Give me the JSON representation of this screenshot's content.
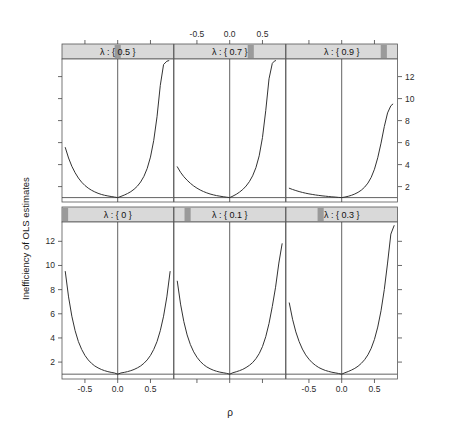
{
  "figure": {
    "ylabel": "Inefficiency of OLS estimates",
    "xlabel": "ρ",
    "background": "#ffffff",
    "line_color": "#333333",
    "strip_fill": "#d9d9d9",
    "strip_marker": "#9a9a9a",
    "border_color": "#555555"
  },
  "chart_data": {
    "type": "line",
    "title": "",
    "subtitle": "",
    "xlabel": "ρ",
    "ylabel": "Inefficiency of OLS estimates",
    "conditioning_variable": "λ",
    "layout": {
      "rows": 2,
      "cols": 3,
      "order": "lattice-bottom-left-first"
    },
    "xlim": [
      -0.85,
      0.85
    ],
    "ylim": [
      0.6,
      13.6
    ],
    "xticks": [
      -0.5,
      0.0,
      0.5
    ],
    "xtick_labels": [
      "-0.5",
      "0.0",
      "0.5"
    ],
    "yticks": [
      2,
      4,
      6,
      8,
      10,
      12
    ],
    "ytick_labels": [
      "2",
      "4",
      "6",
      "8",
      "10",
      "12"
    ],
    "grid": false,
    "legend": null,
    "reference_lines": {
      "vertical_x": 0.0,
      "horizontal_y": 1.0
    },
    "axis_label_placement": {
      "top_axis_labeled_panels": [
        "top-middle"
      ],
      "bottom_axis_labeled_panels": [
        "bottom-left",
        "bottom-right"
      ],
      "left_axis_labeled_rows": [
        "bottom"
      ],
      "right_axis_labeled_rows": [
        "top"
      ]
    },
    "panels": [
      {
        "id": "bottom-left",
        "row": 1,
        "col": 0,
        "strip_label": "λ : { 0 }",
        "lambda": 0,
        "strip_marker_fraction": 0.0,
        "x": [
          -0.8,
          -0.75,
          -0.7,
          -0.65,
          -0.6,
          -0.55,
          -0.5,
          -0.45,
          -0.4,
          -0.35,
          -0.3,
          -0.25,
          -0.2,
          -0.15,
          -0.1,
          -0.05,
          0.0,
          0.05,
          0.1,
          0.15,
          0.2,
          0.25,
          0.3,
          0.35,
          0.4,
          0.45,
          0.5,
          0.55,
          0.6,
          0.65,
          0.7,
          0.75,
          0.8
        ],
        "y": [
          9.5,
          7.4,
          5.8,
          4.6,
          3.7,
          3.05,
          2.55,
          2.18,
          1.9,
          1.68,
          1.52,
          1.39,
          1.29,
          1.21,
          1.15,
          1.1,
          1.0,
          1.1,
          1.15,
          1.21,
          1.29,
          1.39,
          1.52,
          1.68,
          1.9,
          2.18,
          2.55,
          3.05,
          3.7,
          4.6,
          5.8,
          7.4,
          9.5
        ]
      },
      {
        "id": "bottom-middle",
        "row": 1,
        "col": 1,
        "strip_label": "λ : { 0.1 }",
        "lambda": 0.1,
        "strip_marker_fraction": 0.1,
        "x": [
          -0.8,
          -0.75,
          -0.7,
          -0.65,
          -0.6,
          -0.55,
          -0.5,
          -0.45,
          -0.4,
          -0.35,
          -0.3,
          -0.25,
          -0.2,
          -0.15,
          -0.1,
          -0.05,
          0.0,
          0.05,
          0.1,
          0.15,
          0.2,
          0.25,
          0.3,
          0.35,
          0.4,
          0.45,
          0.5,
          0.55,
          0.6,
          0.65,
          0.7,
          0.75,
          0.8
        ],
        "y": [
          8.7,
          6.8,
          5.35,
          4.25,
          3.45,
          2.85,
          2.4,
          2.06,
          1.8,
          1.6,
          1.45,
          1.33,
          1.24,
          1.17,
          1.12,
          1.07,
          1.0,
          1.12,
          1.2,
          1.29,
          1.4,
          1.55,
          1.73,
          1.96,
          2.28,
          2.7,
          3.28,
          4.1,
          5.2,
          6.6,
          8.2,
          10.2,
          11.8
        ]
      },
      {
        "id": "bottom-right",
        "row": 1,
        "col": 2,
        "strip_label": "λ : { 0.3 }",
        "lambda": 0.3,
        "strip_marker_fraction": 0.3,
        "x": [
          -0.8,
          -0.75,
          -0.7,
          -0.65,
          -0.6,
          -0.55,
          -0.5,
          -0.45,
          -0.4,
          -0.35,
          -0.3,
          -0.25,
          -0.2,
          -0.15,
          -0.1,
          -0.05,
          0.0,
          0.05,
          0.1,
          0.15,
          0.2,
          0.25,
          0.3,
          0.35,
          0.4,
          0.45,
          0.5,
          0.55,
          0.6,
          0.65,
          0.7,
          0.75,
          0.8
        ],
        "y": [
          6.9,
          5.55,
          4.5,
          3.7,
          3.08,
          2.6,
          2.24,
          1.95,
          1.73,
          1.55,
          1.42,
          1.31,
          1.23,
          1.16,
          1.11,
          1.06,
          1.0,
          1.12,
          1.22,
          1.34,
          1.48,
          1.66,
          1.9,
          2.2,
          2.6,
          3.14,
          3.88,
          4.9,
          6.25,
          8.0,
          10.2,
          12.6,
          13.3
        ]
      },
      {
        "id": "top-left",
        "row": 0,
        "col": 0,
        "strip_label": "λ : { 0.5 }",
        "lambda": 0.5,
        "strip_marker_fraction": 0.5,
        "x": [
          -0.8,
          -0.75,
          -0.7,
          -0.65,
          -0.6,
          -0.55,
          -0.5,
          -0.45,
          -0.4,
          -0.35,
          -0.3,
          -0.25,
          -0.2,
          -0.15,
          -0.1,
          -0.05,
          0.0,
          0.05,
          0.1,
          0.15,
          0.2,
          0.25,
          0.3,
          0.35,
          0.4,
          0.45,
          0.5,
          0.55,
          0.6,
          0.65,
          0.7,
          0.75,
          0.78
        ],
        "y": [
          5.55,
          4.6,
          3.85,
          3.26,
          2.78,
          2.4,
          2.1,
          1.86,
          1.67,
          1.52,
          1.39,
          1.29,
          1.21,
          1.15,
          1.1,
          1.05,
          1.0,
          1.11,
          1.23,
          1.37,
          1.54,
          1.76,
          2.04,
          2.42,
          2.93,
          3.65,
          4.68,
          6.2,
          8.35,
          11.2,
          13.1,
          13.4,
          13.45
        ]
      },
      {
        "id": "top-middle",
        "row": 0,
        "col": 1,
        "strip_label": "λ : { 0.7 }",
        "lambda": 0.7,
        "strip_marker_fraction": 0.7,
        "x": [
          -0.8,
          -0.75,
          -0.7,
          -0.65,
          -0.6,
          -0.55,
          -0.5,
          -0.45,
          -0.4,
          -0.35,
          -0.3,
          -0.25,
          -0.2,
          -0.15,
          -0.1,
          -0.05,
          0.0,
          0.05,
          0.1,
          0.15,
          0.2,
          0.25,
          0.3,
          0.35,
          0.4,
          0.45,
          0.5,
          0.55,
          0.6,
          0.65,
          0.68,
          0.7
        ],
        "y": [
          3.8,
          3.3,
          2.9,
          2.58,
          2.3,
          2.06,
          1.86,
          1.69,
          1.55,
          1.43,
          1.33,
          1.25,
          1.18,
          1.13,
          1.08,
          1.04,
          1.0,
          1.14,
          1.3,
          1.5,
          1.74,
          2.05,
          2.45,
          2.98,
          3.72,
          4.8,
          6.45,
          8.9,
          11.8,
          13.2,
          13.4,
          13.45
        ]
      },
      {
        "id": "top-right",
        "row": 0,
        "col": 2,
        "strip_label": "λ : { 0.9 }",
        "lambda": 0.9,
        "strip_marker_fraction": 0.9,
        "x": [
          -0.8,
          -0.75,
          -0.7,
          -0.65,
          -0.6,
          -0.55,
          -0.5,
          -0.45,
          -0.4,
          -0.35,
          -0.3,
          -0.25,
          -0.2,
          -0.15,
          -0.1,
          -0.05,
          0.0,
          0.05,
          0.1,
          0.15,
          0.2,
          0.25,
          0.3,
          0.35,
          0.4,
          0.45,
          0.5,
          0.55,
          0.6,
          0.65,
          0.7,
          0.75,
          0.78
        ],
        "y": [
          1.85,
          1.74,
          1.64,
          1.55,
          1.47,
          1.4,
          1.34,
          1.29,
          1.24,
          1.2,
          1.16,
          1.13,
          1.1,
          1.07,
          1.05,
          1.02,
          1.0,
          1.05,
          1.12,
          1.21,
          1.33,
          1.48,
          1.68,
          1.95,
          2.32,
          2.84,
          3.58,
          4.62,
          5.95,
          7.45,
          8.7,
          9.35,
          9.5
        ]
      }
    ]
  }
}
